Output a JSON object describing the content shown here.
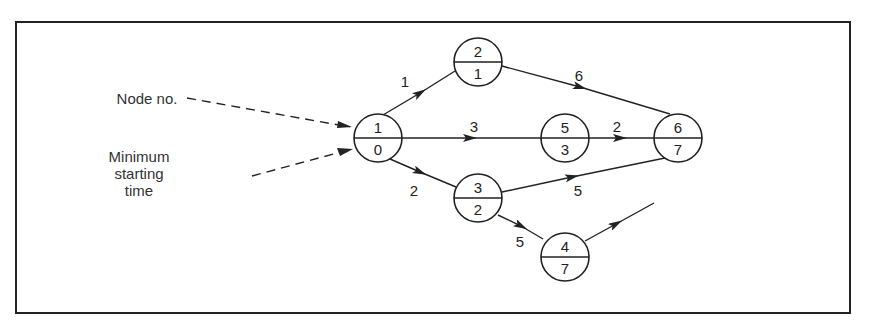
{
  "diagram": {
    "type": "activity-network",
    "annotations": {
      "node_no_label": "Node no.",
      "min_start_label": [
        "Minimum",
        "starting",
        "time"
      ]
    },
    "nodes": [
      {
        "id": 1,
        "node_no": "1",
        "min_start": "0",
        "cx": 378,
        "cy": 138
      },
      {
        "id": 2,
        "node_no": "2",
        "min_start": "1",
        "cx": 478,
        "cy": 62
      },
      {
        "id": 3,
        "node_no": "3",
        "min_start": "2",
        "cx": 478,
        "cy": 198
      },
      {
        "id": 4,
        "node_no": "4",
        "min_start": "7",
        "cx": 565,
        "cy": 257
      },
      {
        "id": 5,
        "node_no": "5",
        "min_start": "3",
        "cx": 565,
        "cy": 138
      },
      {
        "id": 6,
        "node_no": "6",
        "min_start": "7",
        "cx": 678,
        "cy": 138
      }
    ],
    "edges": [
      {
        "from": 1,
        "to": 2,
        "duration": "1"
      },
      {
        "from": 1,
        "to": 5,
        "duration": "3"
      },
      {
        "from": 1,
        "to": 3,
        "duration": "2"
      },
      {
        "from": 2,
        "to": 6,
        "duration": "6"
      },
      {
        "from": 5,
        "to": 6,
        "duration": "2"
      },
      {
        "from": 3,
        "to": 6,
        "duration": "5"
      },
      {
        "from": 3,
        "to": 4,
        "duration": "5"
      },
      {
        "from": 4,
        "to": null,
        "duration": ""
      }
    ]
  }
}
